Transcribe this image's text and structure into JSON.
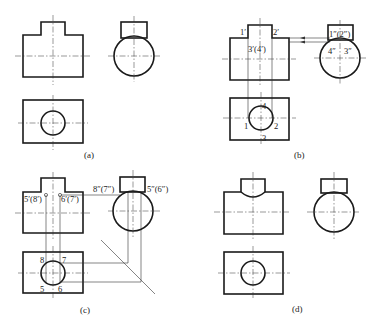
{
  "figure": {
    "panels": [
      {
        "id": "a",
        "caption": "(a)"
      },
      {
        "id": "b",
        "caption": "(b)",
        "labels": {
          "front_1": "1′",
          "front_2": "2′",
          "front_34": "3′(4′)",
          "side_12": "1″(2″)",
          "side_4": "4″",
          "side_3": "3″",
          "top_1": "1",
          "top_2": "2",
          "top_3": "3",
          "top_4": "4"
        }
      },
      {
        "id": "c",
        "caption": "(c)",
        "labels": {
          "front_58": "5′(8′)",
          "front_67": "6′(7′)",
          "side_87": "8″(7″)",
          "side_56": "5″(6″)",
          "top_8": "8",
          "top_7": "7",
          "top_5": "5",
          "top_6": "6"
        }
      },
      {
        "id": "d",
        "caption": "(d)"
      }
    ]
  }
}
